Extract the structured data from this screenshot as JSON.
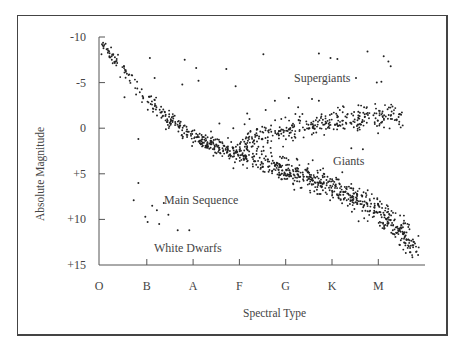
{
  "chart_data": {
    "type": "scatter",
    "title": "",
    "xlabel": "Spectral Type",
    "ylabel": "Absolute Magnitude",
    "x_categories": [
      "O",
      "B",
      "A",
      "F",
      "G",
      "K",
      "M"
    ],
    "y_ticks": [
      "-10",
      "-5",
      "0",
      "+5",
      "+10",
      "+15"
    ],
    "ylim": [
      -10,
      15
    ],
    "y_inverted": true,
    "grid": false,
    "annotations": [
      {
        "text": "Supergiants",
        "x": 4.5,
        "y": -5.5
      },
      {
        "text": "Giants",
        "x": 5.0,
        "y": 2.8
      },
      {
        "text": "Main Sequence",
        "x": 1.4,
        "y": 8.0
      },
      {
        "text": "White Dwarfs",
        "x": 1.2,
        "y": 12.8
      }
    ],
    "series": [
      {
        "name": "Main Sequence",
        "trend": [
          {
            "x": 0.0,
            "y": -9.8
          },
          {
            "x": 0.5,
            "y": -6.5
          },
          {
            "x": 1.0,
            "y": -3.5
          },
          {
            "x": 1.5,
            "y": -1.0
          },
          {
            "x": 2.0,
            "y": 0.8
          },
          {
            "x": 2.5,
            "y": 2.0
          },
          {
            "x": 3.0,
            "y": 3.0
          },
          {
            "x": 3.5,
            "y": 3.8
          },
          {
            "x": 4.0,
            "y": 4.5
          },
          {
            "x": 4.5,
            "y": 5.3
          },
          {
            "x": 5.0,
            "y": 6.3
          },
          {
            "x": 5.5,
            "y": 7.5
          },
          {
            "x": 6.0,
            "y": 9.0
          },
          {
            "x": 6.5,
            "y": 11.3
          },
          {
            "x": 6.85,
            "y": 13.3
          }
        ],
        "count": 900
      },
      {
        "name": "Giants / Supergiants branch",
        "trend": [
          {
            "x": 3.0,
            "y": 1.5
          },
          {
            "x": 3.5,
            "y": 1.0
          },
          {
            "x": 4.0,
            "y": 0.3
          },
          {
            "x": 4.5,
            "y": -0.3
          },
          {
            "x": 5.0,
            "y": -0.8
          },
          {
            "x": 5.5,
            "y": -1.0
          },
          {
            "x": 6.0,
            "y": -1.2
          },
          {
            "x": 6.55,
            "y": -1.3
          }
        ],
        "count": 330
      },
      {
        "name": "White Dwarfs",
        "points": [
          {
            "x": 0.85,
            "y": 6.0
          },
          {
            "x": 0.75,
            "y": 7.9
          },
          {
            "x": 1.0,
            "y": 9.7
          },
          {
            "x": 1.15,
            "y": 8.5
          },
          {
            "x": 1.25,
            "y": 9.0
          },
          {
            "x": 1.4,
            "y": 8.2
          },
          {
            "x": 1.3,
            "y": 10.5
          },
          {
            "x": 1.5,
            "y": 9.5
          },
          {
            "x": 1.7,
            "y": 11.2
          },
          {
            "x": 1.95,
            "y": 11.2
          },
          {
            "x": 1.05,
            "y": 10.3
          }
        ]
      },
      {
        "name": "Bright outliers",
        "points": [
          {
            "x": 0.55,
            "y": -3.4
          },
          {
            "x": 1.1,
            "y": -7.7
          },
          {
            "x": 1.85,
            "y": -7.5
          },
          {
            "x": 2.1,
            "y": -6.6
          },
          {
            "x": 2.75,
            "y": -6.5
          },
          {
            "x": 3.55,
            "y": -8.1
          },
          {
            "x": 4.75,
            "y": -8.2
          },
          {
            "x": 5.0,
            "y": -7.7
          },
          {
            "x": 5.15,
            "y": -7.6
          },
          {
            "x": 5.8,
            "y": -8.4
          },
          {
            "x": 6.15,
            "y": -7.9
          },
          {
            "x": 6.25,
            "y": -7.3
          },
          {
            "x": 6.3,
            "y": -6.8
          },
          {
            "x": 2.95,
            "y": -4.6
          },
          {
            "x": 5.55,
            "y": -5.5
          },
          {
            "x": 1.2,
            "y": -5.5
          },
          {
            "x": 1.8,
            "y": -4.8
          },
          {
            "x": 2.15,
            "y": -5.2
          },
          {
            "x": 6.0,
            "y": -5.0
          },
          {
            "x": 6.1,
            "y": -5.1
          },
          {
            "x": 0.85,
            "y": 1.2
          },
          {
            "x": 3.25,
            "y": -1.0
          },
          {
            "x": 3.6,
            "y": -2.0
          },
          {
            "x": 4.3,
            "y": -2.3
          },
          {
            "x": 4.6,
            "y": -3.2
          },
          {
            "x": 4.75,
            "y": -3.0
          },
          {
            "x": 5.2,
            "y": -2.0
          },
          {
            "x": 5.6,
            "y": -1.8
          },
          {
            "x": 5.45,
            "y": 2.2
          },
          {
            "x": 5.7,
            "y": 2.3
          },
          {
            "x": 2.6,
            "y": -0.5
          },
          {
            "x": 2.9,
            "y": 0.0
          },
          {
            "x": 3.8,
            "y": -3.0
          },
          {
            "x": 4.1,
            "y": -3.3
          },
          {
            "x": 3.2,
            "y": -1.6
          }
        ]
      }
    ]
  },
  "labels": {
    "ylabel": "Absolute Magnitude",
    "xlabel": "Spectral Type",
    "supergiants": "Supergiants",
    "giants": "Giants",
    "main_sequence": "Main Sequence",
    "white_dwarfs": "White Dwarfs",
    "x_ticks": [
      "O",
      "B",
      "A",
      "F",
      "G",
      "K",
      "M"
    ],
    "y_ticks": [
      "-10",
      "-5",
      "0",
      "+5",
      "+10",
      "+15"
    ]
  },
  "colors": {
    "dot": "#222222",
    "axis": "#555555",
    "text": "#444444",
    "frame": "#444444"
  }
}
